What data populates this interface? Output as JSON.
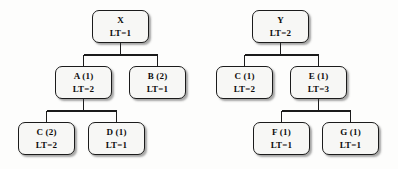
{
  "diagram": {
    "style": {
      "node_fill": "#f7f7f5",
      "node_border": "#1b1b1b",
      "edge_color": "#1b1b1b",
      "text_color": "#0d0d0d",
      "background": "#fdfdfc"
    },
    "trees": [
      {
        "name": "tree-x",
        "root": "X"
      },
      {
        "name": "tree-y",
        "root": "Y"
      }
    ],
    "nodes": [
      {
        "id": "x",
        "label": "X",
        "lt": "LT=1",
        "x": 92,
        "y": 10,
        "tree": "tree-x"
      },
      {
        "id": "a1",
        "label": "A  (1)",
        "lt": "LT=2",
        "x": 55,
        "y": 66,
        "tree": "tree-x"
      },
      {
        "id": "b2",
        "label": "B  (2)",
        "lt": "LT=1",
        "x": 129,
        "y": 66,
        "tree": "tree-x"
      },
      {
        "id": "c2",
        "label": "C  (2)",
        "lt": "LT=2",
        "x": 18,
        "y": 122,
        "tree": "tree-x"
      },
      {
        "id": "d1",
        "label": "D  (1)",
        "lt": "LT=1",
        "x": 88,
        "y": 122,
        "tree": "tree-x"
      },
      {
        "id": "y",
        "label": "Y",
        "lt": "LT=2",
        "x": 252,
        "y": 10,
        "tree": "tree-y"
      },
      {
        "id": "c1",
        "label": "C  (1)",
        "lt": "LT=2",
        "x": 216,
        "y": 66,
        "tree": "tree-y"
      },
      {
        "id": "e1",
        "label": "E  (1)",
        "lt": "LT=3",
        "x": 290,
        "y": 66,
        "tree": "tree-y"
      },
      {
        "id": "f1",
        "label": "F  (1)",
        "lt": "LT=1",
        "x": 253,
        "y": 122,
        "tree": "tree-y"
      },
      {
        "id": "g1",
        "label": "G  (1)",
        "lt": "LT=1",
        "x": 322,
        "y": 122,
        "tree": "tree-y"
      }
    ],
    "edges": [
      {
        "from": "x",
        "to": "a1",
        "name": "edge-x-a"
      },
      {
        "from": "x",
        "to": "b2",
        "name": "edge-x-b"
      },
      {
        "from": "a1",
        "to": "c2",
        "name": "edge-a-c"
      },
      {
        "from": "a1",
        "to": "d1",
        "name": "edge-a-d"
      },
      {
        "from": "y",
        "to": "c1",
        "name": "edge-y-c"
      },
      {
        "from": "y",
        "to": "e1",
        "name": "edge-y-e"
      },
      {
        "from": "e1",
        "to": "f1",
        "name": "edge-e-f"
      },
      {
        "from": "e1",
        "to": "g1",
        "name": "edge-e-g"
      }
    ]
  }
}
